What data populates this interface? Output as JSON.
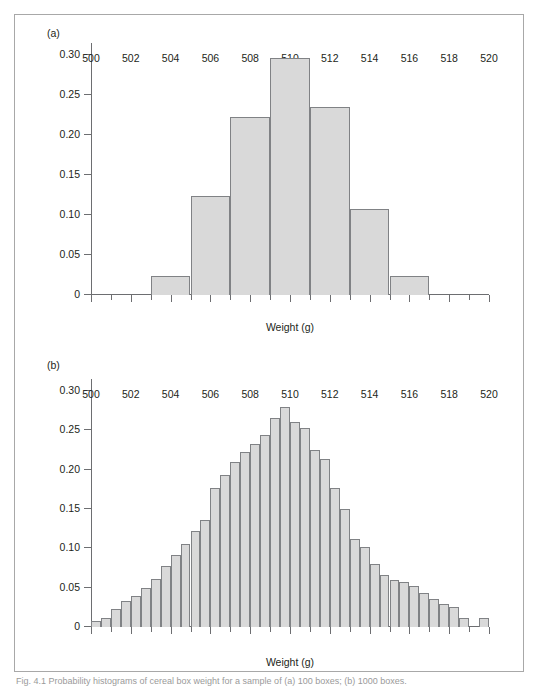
{
  "figure": {
    "caption": "Fig. 4.1  Probability histograms of cereal box weight for a sample of (a) 100 boxes; (b) 1000 boxes."
  },
  "panels": [
    {
      "id": "a",
      "label": "(a)",
      "xlabel": "Weight (g)",
      "ylabel": "",
      "ytick_labels": [
        "0",
        "0.05",
        "0.10",
        "0.15",
        "0.20",
        "0.25",
        "0.30"
      ],
      "ytick_values": [
        0,
        0.05,
        0.1,
        0.15,
        0.2,
        0.25,
        0.3
      ],
      "xtick_labels": [
        "500",
        "502",
        "504",
        "506",
        "508",
        "510",
        "512",
        "514",
        "516",
        "518",
        "520"
      ],
      "xtick_values": [
        500,
        502,
        504,
        506,
        508,
        510,
        512,
        514,
        516,
        518,
        520
      ]
    },
    {
      "id": "b",
      "label": "(b)",
      "xlabel": "Weight (g)",
      "ylabel": "",
      "ytick_labels": [
        "0",
        "0.05",
        "0.10",
        "0.15",
        "0.20",
        "0.25",
        "0.30"
      ],
      "ytick_values": [
        0,
        0.05,
        0.1,
        0.15,
        0.2,
        0.25,
        0.3
      ],
      "xtick_labels": [
        "500",
        "502",
        "504",
        "506",
        "508",
        "510",
        "512",
        "514",
        "516",
        "518",
        "520"
      ],
      "xtick_values": [
        500,
        502,
        504,
        506,
        508,
        510,
        512,
        514,
        516,
        518,
        520
      ]
    }
  ],
  "colors": {
    "bar_fill": "#d9d9d9",
    "bar_stroke": "#808285",
    "axis": "#6d6e71",
    "text": "#231f20",
    "frame": "#a8a8a8"
  },
  "chart_data": [
    {
      "type": "bar",
      "title": "(a)",
      "xlabel": "Weight (g)",
      "ylabel": "",
      "xlim": [
        500,
        520
      ],
      "ylim": [
        0,
        0.315
      ],
      "grid": false,
      "legend": null,
      "bin_width": 2,
      "bin_edges": [
        503,
        505,
        507,
        509,
        511,
        513,
        515,
        517
      ],
      "categories": [
        "503-505",
        "505-507",
        "507-509",
        "509-511",
        "511-513",
        "513-515",
        "515-517"
      ],
      "values": [
        0.024,
        0.124,
        0.222,
        0.296,
        0.235,
        0.108,
        0.024
      ],
      "ytick_values": [
        0,
        0.05,
        0.1,
        0.15,
        0.2,
        0.25,
        0.3
      ],
      "xtick_values": [
        500,
        502,
        504,
        506,
        508,
        510,
        512,
        514,
        516,
        518,
        520
      ]
    },
    {
      "type": "bar",
      "title": "(b)",
      "xlabel": "Weight (g)",
      "ylabel": "",
      "xlim": [
        500,
        520
      ],
      "ylim": [
        0,
        0.315
      ],
      "grid": false,
      "legend": null,
      "bin_width": 0.5,
      "bin_edges": [
        500.0,
        500.5,
        501.0,
        501.5,
        502.0,
        502.5,
        503.0,
        503.5,
        504.0,
        504.5,
        505.0,
        505.5,
        506.0,
        506.5,
        507.0,
        507.5,
        508.0,
        508.5,
        509.0,
        509.5,
        510.0,
        510.5,
        511.0,
        511.5,
        512.0,
        512.5,
        513.0,
        513.5,
        514.0,
        514.5,
        515.0,
        515.5,
        516.0,
        516.5,
        517.0,
        517.5,
        518.0,
        518.5,
        519.0,
        519.5,
        520.0
      ],
      "categories": [
        "500.0-500.5",
        "500.5-501.0",
        "501.0-501.5",
        "501.5-502.0",
        "502.0-502.5",
        "502.5-503.0",
        "503.0-503.5",
        "503.5-504.0",
        "504.0-504.5",
        "504.5-505.0",
        "505.0-505.5",
        "505.5-506.0",
        "506.0-506.5",
        "506.5-507.0",
        "507.0-507.5",
        "507.5-508.0",
        "508.0-508.5",
        "508.5-509.0",
        "509.0-509.5",
        "509.5-510.0",
        "510.0-510.5",
        "510.5-511.0",
        "511.0-511.5",
        "511.5-512.0",
        "512.0-512.5",
        "512.5-513.0",
        "513.0-513.5",
        "513.5-514.0",
        "514.0-514.5",
        "514.5-515.0",
        "515.0-515.5",
        "515.5-516.0",
        "516.0-516.5",
        "516.5-517.0",
        "517.0-517.5",
        "517.5-518.0",
        "518.0-518.5",
        "518.5-519.0",
        "519.0-519.5",
        "519.5-520.0"
      ],
      "values": [
        0.008,
        0.012,
        0.023,
        0.033,
        0.04,
        0.049,
        0.061,
        0.078,
        0.092,
        0.106,
        0.122,
        0.136,
        0.176,
        0.193,
        0.209,
        0.222,
        0.232,
        0.244,
        0.265,
        0.279,
        0.26,
        0.253,
        0.225,
        0.213,
        0.176,
        0.15,
        0.112,
        0.101,
        0.08,
        0.066,
        0.06,
        0.057,
        0.052,
        0.043,
        0.036,
        0.029,
        0.025,
        0.011,
        0.0,
        0.011
      ],
      "ytick_values": [
        0,
        0.05,
        0.1,
        0.15,
        0.2,
        0.25,
        0.3
      ],
      "xtick_values": [
        500,
        502,
        504,
        506,
        508,
        510,
        512,
        514,
        516,
        518,
        520
      ]
    }
  ]
}
